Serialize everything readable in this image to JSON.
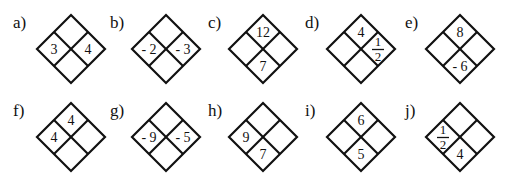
{
  "diamonds": [
    {
      "label": "a)",
      "top": "",
      "left": "3",
      "right": "4",
      "bottom": ""
    },
    {
      "label": "b)",
      "top": "",
      "left": "- 2",
      "right": "- 3",
      "bottom": ""
    },
    {
      "label": "c)",
      "top": "12",
      "left": "",
      "right": "",
      "bottom": "7"
    },
    {
      "label": "d)",
      "top": "4",
      "left": "",
      "right": "1/2",
      "bottom": ""
    },
    {
      "label": "e)",
      "top": "8",
      "left": "",
      "right": "",
      "bottom": "- 6"
    },
    {
      "label": "f)",
      "top": "4",
      "left": "4",
      "right": "",
      "bottom": ""
    },
    {
      "label": "g)",
      "top": "",
      "left": "- 9",
      "right": "- 5",
      "bottom": ""
    },
    {
      "label": "h)",
      "top": "",
      "left": "9",
      "right": "",
      "bottom": "7"
    },
    {
      "label": "i)",
      "top": "6",
      "left": "",
      "right": "",
      "bottom": "5"
    },
    {
      "label": "j)",
      "top": "",
      "left": "1/2",
      "right": "",
      "bottom": "4"
    }
  ]
}
